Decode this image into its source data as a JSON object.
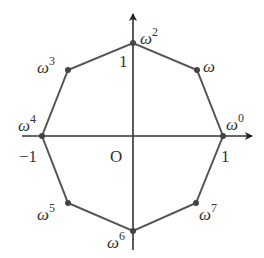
{
  "diagram": {
    "origin_label": "O",
    "axis_ticks": {
      "x_pos": "1",
      "x_neg": "−1",
      "y_pos": "1"
    },
    "vertices": [
      {
        "name": "w0",
        "base": "ω",
        "exp": "0"
      },
      {
        "name": "w1",
        "base": "ω",
        "exp": ""
      },
      {
        "name": "w2",
        "base": "ω",
        "exp": "2"
      },
      {
        "name": "w3",
        "base": "ω",
        "exp": "3"
      },
      {
        "name": "w4",
        "base": "ω",
        "exp": "4"
      },
      {
        "name": "w5",
        "base": "ω",
        "exp": "5"
      },
      {
        "name": "w6",
        "base": "ω",
        "exp": "6"
      },
      {
        "name": "w7",
        "base": "ω",
        "exp": "7"
      }
    ],
    "colors": {
      "line": "#555555",
      "point": "#444444"
    }
  }
}
